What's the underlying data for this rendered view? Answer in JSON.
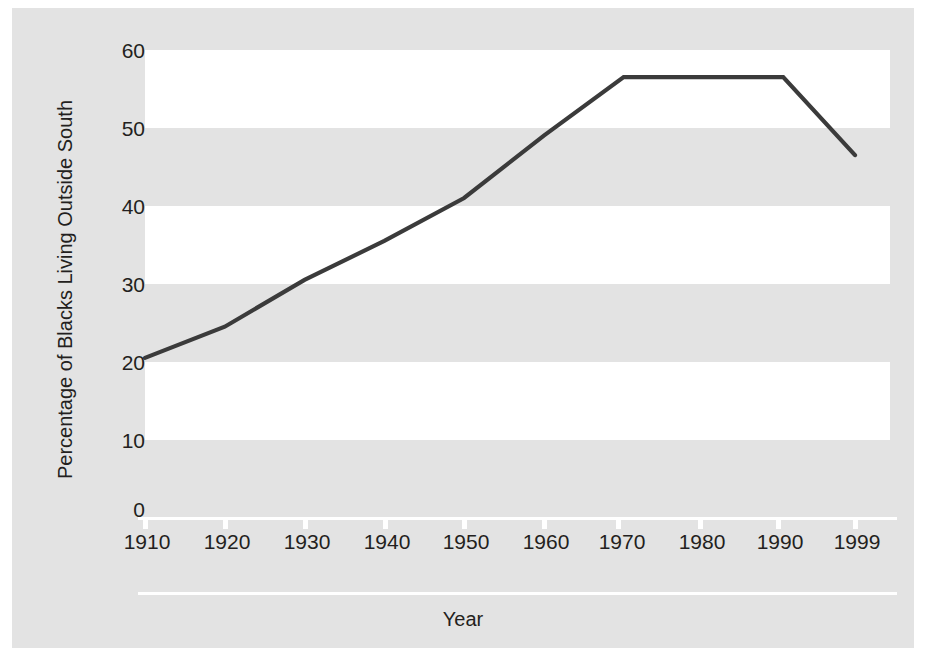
{
  "chart_data": {
    "type": "line",
    "title": "",
    "xlabel": "Year",
    "ylabel": "Percentage of Blacks Living Outside South",
    "x": [
      1910,
      1920,
      1930,
      1940,
      1950,
      1960,
      1970,
      1980,
      1990,
      1999
    ],
    "categories": [
      "1910",
      "1920",
      "1930",
      "1940",
      "1950",
      "1960",
      "1970",
      "1980",
      "1990",
      "1999"
    ],
    "values": [
      19.5,
      23.5,
      29.5,
      34.5,
      40.0,
      48.0,
      55.5,
      55.5,
      55.5,
      45.5
    ],
    "series": [
      {
        "name": "Percentage of Blacks Living Outside South",
        "values": [
          19.5,
          23.5,
          29.5,
          34.5,
          40.0,
          48.0,
          55.5,
          55.5,
          55.5,
          45.5
        ]
      }
    ],
    "xlim": [
      1910,
      1999
    ],
    "ylim": [
      0,
      60
    ],
    "yticks": [
      0,
      10,
      20,
      30,
      40,
      50,
      60
    ],
    "ytick_labels": [
      "0",
      "10",
      "20",
      "30",
      "40",
      "50",
      "60"
    ],
    "xtick_labels": [
      "1910",
      "1920",
      "1930",
      "1940",
      "1950",
      "1960",
      "1970",
      "1980",
      "1990",
      "1999"
    ],
    "grid": false,
    "banded_background": true,
    "legend": "none",
    "line_color": "#3b3b3b",
    "panel_color": "#e3e3e3",
    "band_color": "#ffffff",
    "text_color": "#231f20"
  },
  "axes": {
    "y_title": "Percentage of Blacks Living Outside South",
    "x_title": "Year",
    "y_ticks": [
      {
        "label": "60"
      },
      {
        "label": "50"
      },
      {
        "label": "40"
      },
      {
        "label": "30"
      },
      {
        "label": "20"
      },
      {
        "label": "10"
      },
      {
        "label": "0"
      }
    ],
    "x_ticks": [
      {
        "label": "1910"
      },
      {
        "label": "1920"
      },
      {
        "label": "1930"
      },
      {
        "label": "1940"
      },
      {
        "label": "1950"
      },
      {
        "label": "1960"
      },
      {
        "label": "1970"
      },
      {
        "label": "1980"
      },
      {
        "label": "1990"
      },
      {
        "label": "1999"
      }
    ]
  }
}
